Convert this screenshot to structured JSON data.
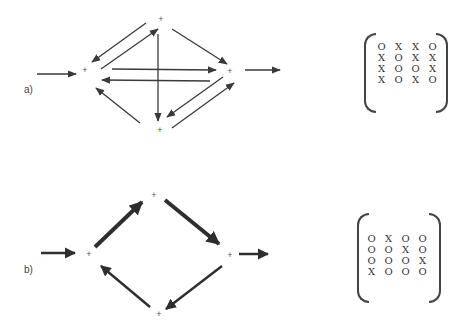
{
  "panels": [
    {
      "label": "a)",
      "node_symbol": "+",
      "nodes": [
        {
          "id": 1,
          "name": "left",
          "x": 85,
          "y": 71
        },
        {
          "id": 2,
          "name": "top",
          "x": 161,
          "y": 20
        },
        {
          "id": 3,
          "name": "right",
          "x": 230,
          "y": 72
        },
        {
          "id": 4,
          "name": "bottom",
          "x": 160,
          "y": 130
        }
      ],
      "edges": [
        {
          "from": 1,
          "to": 2
        },
        {
          "from": 1,
          "to": 3
        },
        {
          "from": 2,
          "to": 1
        },
        {
          "from": 2,
          "to": 3
        },
        {
          "from": 2,
          "to": 4
        },
        {
          "from": 3,
          "to": 1
        },
        {
          "from": 3,
          "to": 4
        },
        {
          "from": 4,
          "to": 1
        },
        {
          "from": 4,
          "to": 3
        }
      ],
      "input_arrow": "in",
      "output_arrow": "out",
      "edge_weight": "thin",
      "matrix": [
        [
          "O",
          "X",
          "X",
          "O"
        ],
        [
          "X",
          "O",
          "X",
          "X"
        ],
        [
          "X",
          "O",
          "O",
          "X"
        ],
        [
          "X",
          "O",
          "X",
          "O"
        ]
      ]
    },
    {
      "label": "b)",
      "node_symbol": "+",
      "nodes": [
        {
          "id": 1,
          "name": "left",
          "x": 89,
          "y": 254
        },
        {
          "id": 2,
          "name": "top",
          "x": 154,
          "y": 196
        },
        {
          "id": 3,
          "name": "right",
          "x": 230,
          "y": 256
        },
        {
          "id": 4,
          "name": "bottom",
          "x": 159,
          "y": 314
        }
      ],
      "edges": [
        {
          "from": 1,
          "to": 2,
          "weight": "heavy"
        },
        {
          "from": 2,
          "to": 3,
          "weight": "heavy"
        },
        {
          "from": 3,
          "to": 4,
          "weight": "medium"
        },
        {
          "from": 4,
          "to": 1,
          "weight": "medium"
        }
      ],
      "input_arrow": "in",
      "output_arrow": "out",
      "edge_weight": "thick",
      "matrix": [
        [
          "O",
          "X",
          "O",
          "O"
        ],
        [
          "O",
          "O",
          "X",
          "O"
        ],
        [
          "O",
          "O",
          "O",
          "X"
        ],
        [
          "X",
          "O",
          "O",
          "O"
        ]
      ]
    }
  ],
  "colors": {
    "ink": "#3a3a3a",
    "background": "#ffffff"
  }
}
